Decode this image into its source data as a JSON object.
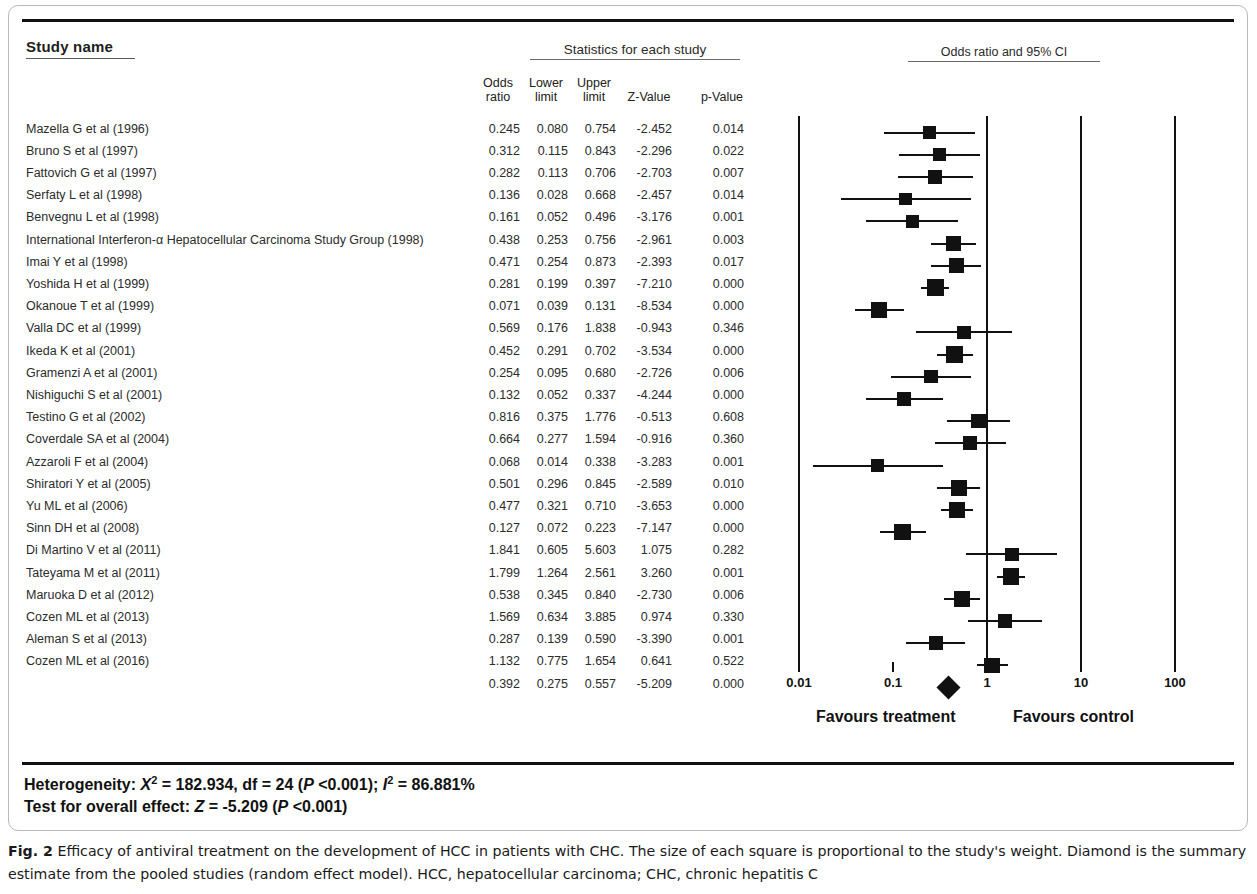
{
  "headers": {
    "study_name": "Study name",
    "statistics": "Statistics for each study",
    "plot": "Odds ratio and 95% CI",
    "columns": {
      "odds_ratio_l1": "Odds",
      "odds_ratio_l2": "ratio",
      "lower_l1": "Lower",
      "lower_l2": "limit",
      "upper_l1": "Upper",
      "upper_l2": "limit",
      "z_value": "Z-Value",
      "p_value": "p-Value"
    }
  },
  "axis": {
    "ticks": [
      "0.01",
      "0.1",
      "1",
      "10",
      "100"
    ],
    "favours_left": "Favours treatment",
    "favours_right": "Favours control"
  },
  "stats": {
    "heterogeneity_prefix": "Heterogeneity: ",
    "heterogeneity_chi_sym": "X",
    "heterogeneity_chi_sup": "2",
    "heterogeneity_mid": " = 182.934, df = 24 (",
    "heterogeneity_p": "P",
    "heterogeneity_p_val": " <0.001); ",
    "heterogeneity_i_sym": "I",
    "heterogeneity_i_sup": "2",
    "heterogeneity_i_val": " = 86.881%",
    "effect_prefix": "Test for overall effect: ",
    "effect_z_sym": "Z",
    "effect_z_val": " = -5.209 (",
    "effect_p": "P",
    "effect_p_val": " <0.001)"
  },
  "caption": {
    "label": "Fig. 2",
    "text": " Efficacy of antiviral treatment on the development of HCC in patients with CHC. The size of each square is proportional to the study's weight. Diamond is the summary estimate from the pooled studies (random effect model). HCC, hepatocellular carcinoma; CHC, chronic hepatitis C"
  },
  "chart_data": {
    "type": "forest",
    "title": "Odds ratio and 95% CI",
    "xlabel": "Odds ratio (log scale)",
    "xscale": "log",
    "xlim": [
      0.01,
      100
    ],
    "xticks": [
      0.01,
      0.1,
      1,
      10,
      100
    ],
    "null_line": 1,
    "columns": [
      "Study name",
      "Odds ratio",
      "Lower limit",
      "Upper limit",
      "Z-Value",
      "p-Value"
    ],
    "rows": [
      {
        "study": "Mazella G et al (1996)",
        "or": "0.245",
        "ll": "0.080",
        "ul": "0.754",
        "z": "-2.452",
        "p": "0.014",
        "or_v": 0.245,
        "ll_v": 0.08,
        "ul_v": 0.754,
        "weight": 0.52
      },
      {
        "study": "Bruno S et al (1997)",
        "or": "0.312",
        "ll": "0.115",
        "ul": "0.843",
        "z": "-2.296",
        "p": "0.022",
        "or_v": 0.312,
        "ll_v": 0.115,
        "ul_v": 0.843,
        "weight": 0.5
      },
      {
        "study": "Fattovich G et al (1997)",
        "or": "0.282",
        "ll": "0.113",
        "ul": "0.706",
        "z": "-2.703",
        "p": "0.007",
        "or_v": 0.282,
        "ll_v": 0.113,
        "ul_v": 0.706,
        "weight": 0.54
      },
      {
        "study": "Serfaty L et al (1998)",
        "or": "0.136",
        "ll": "0.028",
        "ul": "0.668",
        "z": "-2.457",
        "p": "0.014",
        "or_v": 0.136,
        "ll_v": 0.028,
        "ul_v": 0.668,
        "weight": 0.4
      },
      {
        "study": "Benvegnu L et al (1998)",
        "or": "0.161",
        "ll": "0.052",
        "ul": "0.496",
        "z": "-3.176",
        "p": "0.001",
        "or_v": 0.161,
        "ll_v": 0.052,
        "ul_v": 0.496,
        "weight": 0.46
      },
      {
        "study": "International Interferon-α Hepatocellular Carcinoma Study Group (1998)",
        "or": "0.438",
        "ll": "0.253",
        "ul": "0.756",
        "z": "-2.961",
        "p": "0.003",
        "or_v": 0.438,
        "ll_v": 0.253,
        "ul_v": 0.756,
        "weight": 0.72
      },
      {
        "study": "Imai Y et al (1998)",
        "or": "0.471",
        "ll": "0.254",
        "ul": "0.873",
        "z": "-2.393",
        "p": "0.017",
        "or_v": 0.471,
        "ll_v": 0.254,
        "ul_v": 0.873,
        "weight": 0.68
      },
      {
        "study": "Yoshida H et al (1999)",
        "or": "0.281",
        "ll": "0.199",
        "ul": "0.397",
        "z": "-7.210",
        "p": "0.000",
        "or_v": 0.281,
        "ll_v": 0.199,
        "ul_v": 0.397,
        "weight": 0.9
      },
      {
        "study": "Okanoue T et al (1999)",
        "or": "0.071",
        "ll": "0.039",
        "ul": "0.131",
        "z": "-8.534",
        "p": "0.000",
        "or_v": 0.071,
        "ll_v": 0.039,
        "ul_v": 0.131,
        "weight": 0.8
      },
      {
        "study": "Valla DC et al (1999)",
        "or": "0.569",
        "ll": "0.176",
        "ul": "1.838",
        "z": "-0.943",
        "p": "0.346",
        "or_v": 0.569,
        "ll_v": 0.176,
        "ul_v": 1.838,
        "weight": 0.5
      },
      {
        "study": "Ikeda K et al (2001)",
        "or": "0.452",
        "ll": "0.291",
        "ul": "0.702",
        "z": "-3.534",
        "p": "0.000",
        "or_v": 0.452,
        "ll_v": 0.291,
        "ul_v": 0.702,
        "weight": 0.82
      },
      {
        "study": "Gramenzi A et al (2001)",
        "or": "0.254",
        "ll": "0.095",
        "ul": "0.680",
        "z": "-2.726",
        "p": "0.006",
        "or_v": 0.254,
        "ll_v": 0.095,
        "ul_v": 0.68,
        "weight": 0.5
      },
      {
        "study": "Nishiguchi S et al (2001)",
        "or": "0.132",
        "ll": "0.052",
        "ul": "0.337",
        "z": "-4.244",
        "p": "0.000",
        "or_v": 0.132,
        "ll_v": 0.052,
        "ul_v": 0.337,
        "weight": 0.56
      },
      {
        "study": "Testino G et al (2002)",
        "or": "0.816",
        "ll": "0.375",
        "ul": "1.776",
        "z": "-0.513",
        "p": "0.608",
        "or_v": 0.816,
        "ll_v": 0.375,
        "ul_v": 1.776,
        "weight": 0.6
      },
      {
        "study": "Coverdale SA et al (2004)",
        "or": "0.664",
        "ll": "0.277",
        "ul": "1.594",
        "z": "-0.916",
        "p": "0.360",
        "or_v": 0.664,
        "ll_v": 0.277,
        "ul_v": 1.594,
        "weight": 0.58
      },
      {
        "study": "Azzaroli F et al (2004)",
        "or": "0.068",
        "ll": "0.014",
        "ul": "0.338",
        "z": "-3.283",
        "p": "0.001",
        "or_v": 0.068,
        "ll_v": 0.014,
        "ul_v": 0.338,
        "weight": 0.44
      },
      {
        "study": "Shiratori Y et al (2005)",
        "or": "0.501",
        "ll": "0.296",
        "ul": "0.845",
        "z": "-2.589",
        "p": "0.010",
        "or_v": 0.501,
        "ll_v": 0.296,
        "ul_v": 0.845,
        "weight": 0.74
      },
      {
        "study": "Yu ML et al (2006)",
        "or": "0.477",
        "ll": "0.321",
        "ul": "0.710",
        "z": "-3.653",
        "p": "0.000",
        "or_v": 0.477,
        "ll_v": 0.321,
        "ul_v": 0.71,
        "weight": 0.84
      },
      {
        "study": "Sinn DH et al (2008)",
        "or": "0.127",
        "ll": "0.072",
        "ul": "0.223",
        "z": "-7.147",
        "p": "0.000",
        "or_v": 0.127,
        "ll_v": 0.072,
        "ul_v": 0.223,
        "weight": 0.84
      },
      {
        "study": "Di Martino V et al (2011)",
        "or": "1.841",
        "ll": "0.605",
        "ul": "5.603",
        "z": "1.075",
        "p": "0.282",
        "or_v": 1.841,
        "ll_v": 0.605,
        "ul_v": 5.603,
        "weight": 0.5
      },
      {
        "study": "Tateyama M et al (2011)",
        "or": "1.799",
        "ll": "1.264",
        "ul": "2.561",
        "z": "3.260",
        "p": "0.001",
        "or_v": 1.799,
        "ll_v": 1.264,
        "ul_v": 2.561,
        "weight": 0.86
      },
      {
        "study": "Maruoka D et al (2012)",
        "or": "0.538",
        "ll": "0.345",
        "ul": "0.840",
        "z": "-2.730",
        "p": "0.006",
        "or_v": 0.538,
        "ll_v": 0.345,
        "ul_v": 0.84,
        "weight": 0.78
      },
      {
        "study": "Cozen ML et al (2013)",
        "or": "1.569",
        "ll": "0.634",
        "ul": "3.885",
        "z": "0.974",
        "p": "0.330",
        "or_v": 1.569,
        "ll_v": 0.634,
        "ul_v": 3.885,
        "weight": 0.58
      },
      {
        "study": "Aleman S et al (2013)",
        "or": "0.287",
        "ll": "0.139",
        "ul": "0.590",
        "z": "-3.390",
        "p": "0.001",
        "or_v": 0.287,
        "ll_v": 0.139,
        "ul_v": 0.59,
        "weight": 0.62
      },
      {
        "study": "Cozen ML et al (2016)",
        "or": "1.132",
        "ll": "0.775",
        "ul": "1.654",
        "z": "0.641",
        "p": "0.522",
        "or_v": 1.132,
        "ll_v": 0.775,
        "ul_v": 1.654,
        "weight": 0.7
      }
    ],
    "summary": {
      "study": "",
      "or": "0.392",
      "ll": "0.275",
      "ul": "0.557",
      "z": "-5.209",
      "p": "0.000",
      "or_v": 0.392,
      "ll_v": 0.275,
      "ul_v": 0.557
    }
  }
}
